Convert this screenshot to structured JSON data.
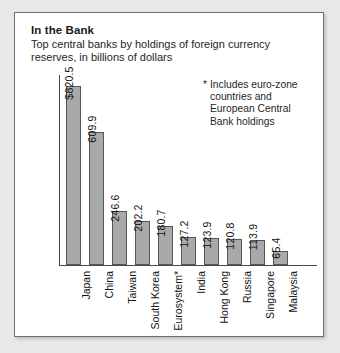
{
  "chart_data": {
    "type": "bar",
    "title": "In the Bank",
    "subtitle": "Top central banks by holdings of foreign currency reserves, in billions of dollars",
    "footnote_marker": "*",
    "footnote": "Includes euro-zone countries and European Central Bank holdings",
    "xlabel": "",
    "ylabel": "",
    "ylim": [
      0,
      870
    ],
    "grid": false,
    "legend": "none",
    "value_unit": "billions of dollars",
    "categories": [
      "Japan",
      "China",
      "Taiwan",
      "South Korea",
      "Eurosystem*",
      "India",
      "Hong Kong",
      "Russia",
      "Singapore",
      "Malaysia"
    ],
    "values": [
      820.5,
      609.9,
      246.6,
      202.2,
      180.7,
      127.2,
      123.9,
      120.8,
      113.9,
      65.4
    ],
    "value_labels": [
      "$820.5",
      "609.9",
      "246.6",
      "202.2",
      "180.7",
      "127.2",
      "123.9",
      "120.8",
      "113.9",
      "65.4"
    ],
    "bar_color": "#a9a9a9",
    "bar_edge_color": "#565656",
    "axis_color": "#4a4a4a",
    "panel_background": "#ffffff",
    "page_background": "#e8e8e6"
  }
}
